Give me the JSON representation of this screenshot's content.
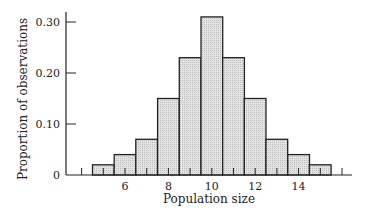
{
  "chart_data": {
    "type": "bar",
    "title": "",
    "xlabel": "Population size",
    "ylabel": "Proportion of observations",
    "categories": [
      5,
      6,
      7,
      8,
      9,
      10,
      11,
      12,
      13,
      14,
      15
    ],
    "values": [
      0.02,
      0.04,
      0.07,
      0.15,
      0.23,
      0.31,
      0.23,
      0.15,
      0.07,
      0.04,
      0.02
    ],
    "x_tick_labels": [
      "6",
      "8",
      "10",
      "12",
      "14"
    ],
    "x_ticks": [
      6,
      8,
      10,
      12,
      14
    ],
    "y_tick_labels": [
      "0",
      "0.10",
      "0.20",
      "0.30"
    ],
    "y_ticks": [
      0,
      0.1,
      0.2,
      0.3
    ],
    "ylim": [
      0,
      0.32
    ],
    "xlim": [
      3.5,
      16.5
    ],
    "grid": false,
    "legend": null,
    "bar_fill": "#d9d9d9",
    "bar_stroke": "#222222"
  }
}
